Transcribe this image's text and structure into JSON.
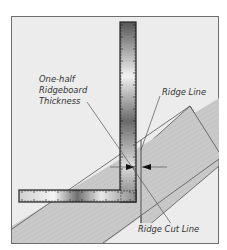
{
  "diagram": {
    "labels": {
      "half_thickness_line1": "One-half",
      "half_thickness_line2": "Ridgeboard",
      "half_thickness_line3": "Thickness",
      "ridge_line": "Ridge Line",
      "ridge_cut_line": "Ridge Cut Line"
    },
    "elements": [
      "framing-square",
      "rafter-board",
      "ridgeboard",
      "ridge-line",
      "ridge-cut-line",
      "dimension-arrows"
    ],
    "colors": {
      "background": "#ececec",
      "frame_border": "#6e6e6e",
      "board_fill": "#c8c8c8",
      "board_stroke": "#555555",
      "square_dark": "#3a3a3a",
      "square_light": "#e6e6e6",
      "line": "#444444"
    }
  }
}
